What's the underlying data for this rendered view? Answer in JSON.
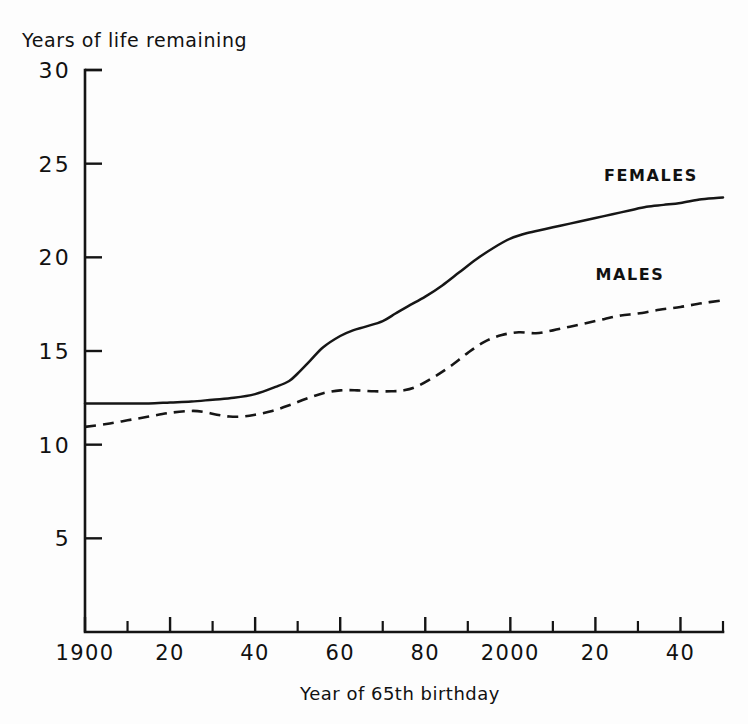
{
  "chart_data": {
    "type": "line",
    "title": "",
    "xlabel": "Year of 65th birthday",
    "ylabel": "Years of life remaining",
    "xlim": [
      1900,
      2050
    ],
    "ylim": [
      0,
      30
    ],
    "grid": false,
    "legend_position": "inline-annotation",
    "x_ticks": [
      {
        "value": 1900,
        "label": "1900",
        "major": true
      },
      {
        "value": 1910,
        "label": "",
        "major": false
      },
      {
        "value": 1920,
        "label": "20",
        "major": true
      },
      {
        "value": 1930,
        "label": "",
        "major": false
      },
      {
        "value": 1940,
        "label": "40",
        "major": true
      },
      {
        "value": 1950,
        "label": "",
        "major": false
      },
      {
        "value": 1960,
        "label": "60",
        "major": true
      },
      {
        "value": 1970,
        "label": "",
        "major": false
      },
      {
        "value": 1980,
        "label": "80",
        "major": true
      },
      {
        "value": 1990,
        "label": "",
        "major": false
      },
      {
        "value": 2000,
        "label": "2000",
        "major": true
      },
      {
        "value": 2010,
        "label": "",
        "major": false
      },
      {
        "value": 2020,
        "label": "20",
        "major": true
      },
      {
        "value": 2030,
        "label": "",
        "major": false
      },
      {
        "value": 2040,
        "label": "40",
        "major": true
      },
      {
        "value": 2050,
        "label": "",
        "major": false
      }
    ],
    "y_ticks": [
      {
        "value": 30,
        "label": "30"
      },
      {
        "value": 25,
        "label": "25"
      },
      {
        "value": 20,
        "label": "20"
      },
      {
        "value": 15,
        "label": "15"
      },
      {
        "value": 10,
        "label": "10"
      },
      {
        "value": 5,
        "label": "5"
      }
    ],
    "series": [
      {
        "name": "FEMALES",
        "style": "solid",
        "color": "#161616",
        "label_x": 2022,
        "label_y": 24.1,
        "x": [
          1900,
          1905,
          1910,
          1915,
          1920,
          1925,
          1930,
          1935,
          1940,
          1945,
          1948,
          1950,
          1953,
          1956,
          1960,
          1963,
          1966,
          1970,
          1973,
          1976,
          1980,
          1984,
          1988,
          1992,
          1996,
          2000,
          2004,
          2008,
          2012,
          2016,
          2020,
          2024,
          2028,
          2032,
          2036,
          2040,
          2045,
          2050
        ],
        "y": [
          12.2,
          12.2,
          12.2,
          12.2,
          12.25,
          12.3,
          12.4,
          12.5,
          12.7,
          13.1,
          13.4,
          13.8,
          14.5,
          15.2,
          15.8,
          16.1,
          16.3,
          16.6,
          17.0,
          17.4,
          17.9,
          18.5,
          19.2,
          19.9,
          20.5,
          21.0,
          21.3,
          21.5,
          21.7,
          21.9,
          22.1,
          22.3,
          22.5,
          22.7,
          22.8,
          22.9,
          23.1,
          23.2
        ]
      },
      {
        "name": "MALES",
        "style": "dashed",
        "color": "#161616",
        "label_x": 2020,
        "label_y": 18.8,
        "x": [
          1900,
          1905,
          1910,
          1915,
          1920,
          1925,
          1928,
          1931,
          1934,
          1937,
          1940,
          1944,
          1948,
          1952,
          1956,
          1960,
          1964,
          1968,
          1972,
          1975,
          1978,
          1982,
          1986,
          1990,
          1994,
          1998,
          2002,
          2006,
          2010,
          2014,
          2018,
          2022,
          2026,
          2030,
          2035,
          2040,
          2045,
          2050
        ],
        "y": [
          10.95,
          11.1,
          11.3,
          11.5,
          11.7,
          11.8,
          11.75,
          11.6,
          11.5,
          11.5,
          11.6,
          11.8,
          12.1,
          12.45,
          12.75,
          12.9,
          12.9,
          12.85,
          12.85,
          12.9,
          13.1,
          13.6,
          14.2,
          14.9,
          15.5,
          15.85,
          16.0,
          15.95,
          16.1,
          16.3,
          16.5,
          16.7,
          16.9,
          17.0,
          17.2,
          17.35,
          17.55,
          17.7
        ]
      }
    ]
  },
  "axes_geometry": {
    "plot_left": 85,
    "plot_right": 723,
    "plot_top": 70,
    "plot_bottom": 632
  },
  "labels": {
    "y_axis_title": "Years of life remaining",
    "x_axis_title": "Year of 65th birthday"
  }
}
